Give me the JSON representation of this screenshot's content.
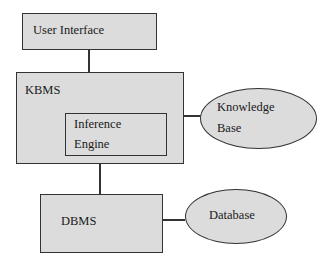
{
  "diagram": {
    "nodes": {
      "user_interface": {
        "label": "User Interface"
      },
      "kbms": {
        "label": "KBMS"
      },
      "inference_engine": {
        "line1": "Inference",
        "line2": "Engine"
      },
      "knowledge_base": {
        "line1": "Knowledge",
        "line2": "Base"
      },
      "dbms": {
        "label": "DBMS"
      },
      "database": {
        "label": "Database"
      }
    },
    "edges": [
      {
        "from": "User Interface",
        "to": "KBMS"
      },
      {
        "from": "KBMS",
        "to": "Knowledge Base"
      },
      {
        "from": "KBMS",
        "to": "DBMS"
      },
      {
        "from": "DBMS",
        "to": "Database"
      }
    ],
    "colors": {
      "fill": "#dcdcdc",
      "stroke": "#333333"
    }
  }
}
